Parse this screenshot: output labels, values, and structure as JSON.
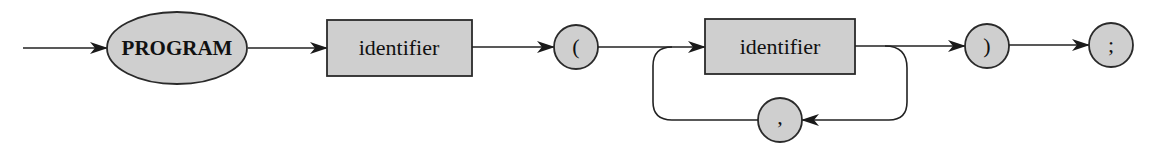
{
  "diagram": {
    "colors": {
      "node_fill": "#cfcfcf",
      "stroke": "#222222",
      "background": "#ffffff"
    },
    "nodes": [
      {
        "id": "program",
        "type": "keyword-ellipse",
        "label": "PROGRAM"
      },
      {
        "id": "identifier-1",
        "type": "nonterminal-box",
        "label": "identifier"
      },
      {
        "id": "lparen",
        "type": "terminal-circle",
        "label": "("
      },
      {
        "id": "identifier-2",
        "type": "nonterminal-box",
        "label": "identifier"
      },
      {
        "id": "comma",
        "type": "terminal-circle",
        "label": ","
      },
      {
        "id": "rparen",
        "type": "terminal-circle",
        "label": ")"
      },
      {
        "id": "semicolon",
        "type": "terminal-circle",
        "label": ";"
      }
    ],
    "edges": [
      {
        "from": "start",
        "to": "program"
      },
      {
        "from": "program",
        "to": "identifier-1"
      },
      {
        "from": "identifier-1",
        "to": "lparen"
      },
      {
        "from": "lparen",
        "to": "identifier-2"
      },
      {
        "from": "identifier-2",
        "to": "rparen"
      },
      {
        "from": "identifier-2",
        "to": "comma",
        "kind": "loop-back"
      },
      {
        "from": "comma",
        "to": "identifier-2",
        "kind": "loop-back"
      },
      {
        "from": "rparen",
        "to": "semicolon"
      }
    ]
  }
}
